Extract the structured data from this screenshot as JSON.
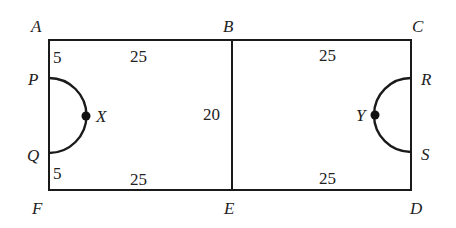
{
  "diagram": {
    "vertices": {
      "A": "A",
      "B": "B",
      "C": "C",
      "D": "D",
      "E": "E",
      "F": "F",
      "P": "P",
      "Q": "Q",
      "R": "R",
      "S": "S",
      "X": "X",
      "Y": "Y"
    },
    "measures": {
      "AP": "5",
      "QF": "5",
      "AB": "25",
      "FE": "25",
      "BC": "25",
      "ED": "25",
      "BE": "20"
    },
    "colors": {
      "line": "#1a1a1a",
      "text": "#222222",
      "background": "#ffffff"
    }
  }
}
